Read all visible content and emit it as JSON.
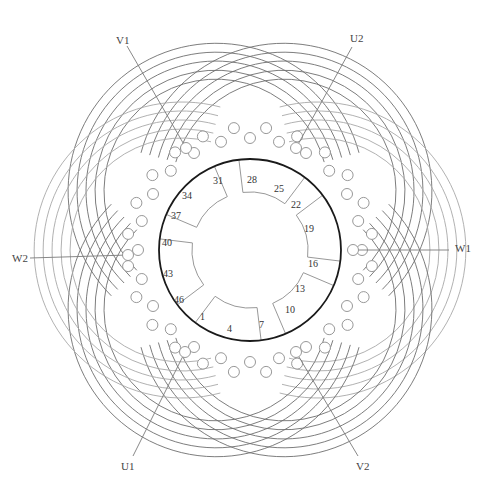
{
  "diagram": {
    "title": "",
    "type": "three-phase stator winding diagram",
    "slot_count": 48,
    "center": [
      250,
      250
    ],
    "stator_radius": 91,
    "colors": {
      "stator": "#1a1a1a",
      "coil_dark": "#6e6e6e",
      "coil_light": "#a8a8a8",
      "slot": "#8c8c8c",
      "lead": "#7a7a7a",
      "text": "#333333"
    },
    "slot_labels": [
      {
        "text": "28",
        "x": 247,
        "y": 183
      },
      {
        "text": "25",
        "x": 274,
        "y": 192
      },
      {
        "text": "22",
        "x": 291,
        "y": 208
      },
      {
        "text": "19",
        "x": 304,
        "y": 232
      },
      {
        "text": "16",
        "x": 308,
        "y": 267
      },
      {
        "text": "13",
        "x": 295,
        "y": 292
      },
      {
        "text": "10",
        "x": 285,
        "y": 313
      },
      {
        "text": "7",
        "x": 259,
        "y": 328
      },
      {
        "text": "4",
        "x": 227,
        "y": 332
      },
      {
        "text": "1",
        "x": 200,
        "y": 320
      },
      {
        "text": "46",
        "x": 174,
        "y": 303
      },
      {
        "text": "43",
        "x": 163,
        "y": 277
      },
      {
        "text": "40",
        "x": 162,
        "y": 246
      },
      {
        "text": "37",
        "x": 171,
        "y": 219
      },
      {
        "text": "34",
        "x": 182,
        "y": 199
      },
      {
        "text": "31",
        "x": 213,
        "y": 184
      }
    ],
    "terminals": [
      {
        "id": "V1",
        "label": "V1",
        "label_x": 116,
        "label_y": 44,
        "line": [
          [
            127,
            46
          ],
          [
            186,
            148
          ]
        ]
      },
      {
        "id": "U2",
        "label": "U2",
        "label_x": 350,
        "label_y": 42,
        "line": [
          [
            352,
            47
          ],
          [
            296,
            148
          ]
        ]
      },
      {
        "id": "W1",
        "label": "W1",
        "label_x": 455,
        "label_y": 252,
        "line": [
          [
            449,
            250
          ],
          [
            353,
            250
          ]
        ]
      },
      {
        "id": "V2",
        "label": "V2",
        "label_x": 356,
        "label_y": 470,
        "line": [
          [
            358,
            456
          ],
          [
            296,
            352
          ]
        ]
      },
      {
        "id": "U1",
        "label": "U1",
        "label_x": 121,
        "label_y": 470,
        "line": [
          [
            133,
            456
          ],
          [
            185,
            352
          ]
        ]
      },
      {
        "id": "W2",
        "label": "W2",
        "label_x": 12,
        "label_y": 262,
        "line": [
          [
            30,
            258
          ],
          [
            128,
            255
          ]
        ]
      }
    ],
    "pole_phase_groups": [
      {
        "angle": -60,
        "shade": "dark"
      },
      {
        "angle": -120,
        "shade": "dark"
      },
      {
        "angle": 0,
        "shade": "light"
      },
      {
        "angle": 60,
        "shade": "dark"
      },
      {
        "angle": 120,
        "shade": "dark"
      },
      {
        "angle": 180,
        "shade": "light"
      },
      {
        "angle": -90,
        "shade": "light"
      },
      {
        "angle": 90,
        "shade": "dark"
      }
    ]
  }
}
